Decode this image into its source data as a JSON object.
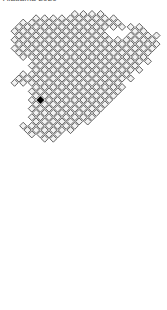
{
  "title": {
    "text": "Alabama 2020",
    "clipped": true
  },
  "colors": {
    "cell_fill": "#f2f2f2",
    "cell_stroke": "#3a3a3a",
    "highlight_fill": "#000000",
    "highlight_stroke": "#000000",
    "background": "#ffffff",
    "title_color": "#4a4a4a"
  },
  "chart_data": {
    "type": "heatmap",
    "title": "Alabama 2020",
    "xlabel": "",
    "ylabel": "",
    "grid": true,
    "legend_position": "none",
    "tile": {
      "shape": "diamond",
      "size": 7.0,
      "pitch_x": 8.6,
      "pitch_y": 8.6,
      "rotation_deg": 45,
      "origin_x": 6.0,
      "origin_y": 10.0
    },
    "highlighted_cell": {
      "col": 4,
      "row": 20,
      "value": 1
    },
    "rows": [
      {
        "row": 0,
        "cols": [
          8,
          9,
          10,
          11
        ]
      },
      {
        "row": 1,
        "cols": [
          3,
          4,
          5,
          6,
          7,
          8,
          9,
          10,
          11,
          12
        ]
      },
      {
        "row": 2,
        "cols": [
          2,
          3,
          4,
          5,
          6,
          7,
          8,
          9,
          10,
          11,
          12,
          13
        ]
      },
      {
        "row": 3,
        "cols": [
          1,
          2,
          3,
          4,
          5,
          6,
          7,
          8,
          9,
          10,
          11,
          12,
          13,
          14,
          15
        ]
      },
      {
        "row": 4,
        "cols": [
          1,
          2,
          3,
          4,
          5,
          6,
          7,
          8,
          9,
          10,
          11,
          15,
          16
        ]
      },
      {
        "row": 5,
        "cols": [
          1,
          2,
          3,
          4,
          5,
          6,
          7,
          8,
          9,
          10,
          11,
          14,
          15,
          16,
          17
        ]
      },
      {
        "row": 6,
        "cols": [
          1,
          2,
          3,
          4,
          5,
          6,
          7,
          8,
          9,
          10,
          11,
          12,
          13,
          14,
          15,
          16,
          17
        ]
      },
      {
        "row": 7,
        "cols": [
          1,
          2,
          3,
          4,
          5,
          6,
          7,
          8,
          9,
          10,
          11,
          12,
          13,
          14,
          15,
          16,
          17
        ]
      },
      {
        "row": 8,
        "cols": [
          1,
          2,
          3,
          4,
          5,
          6,
          7,
          8,
          9,
          10,
          11,
          12,
          13,
          14,
          15,
          16,
          17
        ]
      },
      {
        "row": 9,
        "cols": [
          1,
          2,
          3,
          4,
          5,
          6,
          7,
          8,
          9,
          10,
          11,
          12,
          13,
          14,
          15,
          16
        ]
      },
      {
        "row": 10,
        "cols": [
          2,
          3,
          4,
          5,
          6,
          7,
          8,
          9,
          10,
          11,
          12,
          13,
          14,
          15,
          16
        ]
      },
      {
        "row": 11,
        "cols": [
          3,
          4,
          5,
          6,
          7,
          8,
          9,
          10,
          11,
          12,
          13,
          14,
          15,
          16
        ]
      },
      {
        "row": 12,
        "cols": [
          3,
          4,
          5,
          6,
          7,
          8,
          9,
          10,
          11,
          12,
          13,
          14,
          15
        ]
      },
      {
        "row": 13,
        "cols": [
          3,
          4,
          5,
          6,
          7,
          8,
          9,
          10,
          11,
          12,
          13,
          14,
          15
        ]
      },
      {
        "row": 14,
        "cols": [
          2,
          3,
          4,
          5,
          6,
          7,
          8,
          9,
          10,
          11,
          12,
          13,
          14
        ]
      },
      {
        "row": 15,
        "cols": [
          1,
          2,
          3,
          4,
          5,
          6,
          7,
          8,
          9,
          10,
          11,
          12,
          13,
          14
        ]
      },
      {
        "row": 16,
        "cols": [
          1,
          2,
          3,
          4,
          5,
          6,
          7,
          8,
          9,
          10,
          11,
          12,
          13
        ]
      },
      {
        "row": 17,
        "cols": [
          3,
          4,
          5,
          6,
          7,
          8,
          9,
          10,
          11,
          12,
          13
        ]
      },
      {
        "row": 18,
        "cols": [
          3,
          4,
          5,
          6,
          7,
          8,
          9,
          10,
          11,
          12,
          13
        ]
      },
      {
        "row": 19,
        "cols": [
          3,
          4,
          5,
          6,
          7,
          8,
          9,
          10,
          11,
          12
        ]
      },
      {
        "row": 20,
        "cols": [
          3,
          4,
          5,
          6,
          7,
          8,
          9,
          10,
          11,
          12
        ]
      },
      {
        "row": 21,
        "cols": [
          3,
          4,
          5,
          6,
          7,
          8,
          9,
          10,
          11
        ]
      },
      {
        "row": 22,
        "cols": [
          3,
          4,
          5,
          6,
          7,
          8,
          9,
          10,
          11
        ]
      },
      {
        "row": 23,
        "cols": [
          3,
          4,
          5,
          6,
          7,
          8,
          9,
          10
        ]
      },
      {
        "row": 24,
        "cols": [
          3,
          4,
          5,
          6,
          7,
          8,
          9,
          10
        ]
      },
      {
        "row": 25,
        "cols": [
          3,
          4,
          5,
          6,
          7,
          8,
          9
        ]
      },
      {
        "row": 26,
        "cols": [
          2,
          3,
          4,
          5,
          6,
          7,
          8
        ]
      },
      {
        "row": 27,
        "cols": [
          2,
          3,
          4,
          5,
          6,
          7
        ]
      },
      {
        "row": 28,
        "cols": [
          3,
          4,
          5,
          6
        ]
      },
      {
        "row": 29,
        "cols": [
          4,
          5
        ]
      }
    ]
  }
}
